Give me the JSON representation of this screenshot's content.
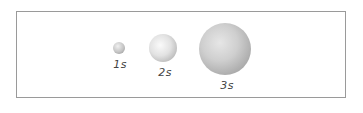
{
  "diagram": {
    "type": "orbital-size-comparison",
    "orbitals": [
      {
        "label": "1s",
        "cx": 119,
        "cy": 48,
        "r": 6
      },
      {
        "label": "2s",
        "cx": 163,
        "cy": 48,
        "r": 14
      },
      {
        "label": "3s",
        "cx": 225,
        "cy": 49,
        "r": 26
      }
    ],
    "colors": {
      "border": "#9a9a9a",
      "sphere_light": "#f4f4f4",
      "sphere_mid": "#c8c8c8",
      "sphere_dark": "#8a8a8a",
      "label": "#444444"
    }
  }
}
